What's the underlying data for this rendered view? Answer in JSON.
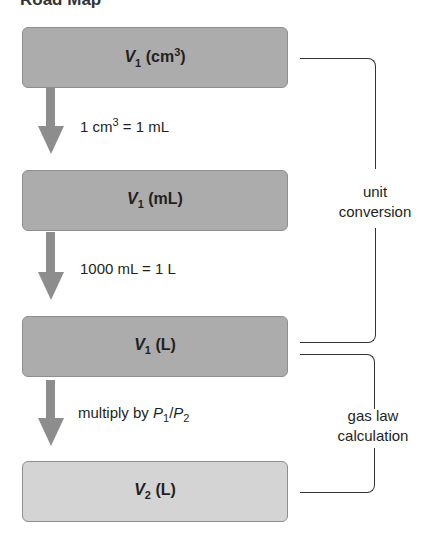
{
  "title": "Road Map",
  "boxes": [
    {
      "var": "V",
      "sub": "1",
      "unit": " (cm",
      "sup": "3",
      "close": ")"
    },
    {
      "var": "V",
      "sub": "1",
      "unit": " (mL)"
    },
    {
      "var": "V",
      "sub": "1",
      "unit": " (L)"
    },
    {
      "var": "V",
      "sub": "2",
      "unit": " (L)"
    }
  ],
  "steps": [
    {
      "a": "1 cm",
      "sup": "3",
      "b": " = 1 mL"
    },
    {
      "text": "1000 mL = 1 L"
    },
    {
      "a": "multiply by ",
      "p1": "P",
      "s1": "1",
      "slash": "/",
      "p2": "P",
      "s2": "2"
    }
  ],
  "brackets": [
    {
      "line1": "unit",
      "line2": "conversion"
    },
    {
      "line1": "gas law",
      "line2": "calculation"
    }
  ],
  "colors": {
    "box_dark": "#acacac",
    "box_light": "#d4d4d4",
    "arrow": "#8d8d8d"
  }
}
